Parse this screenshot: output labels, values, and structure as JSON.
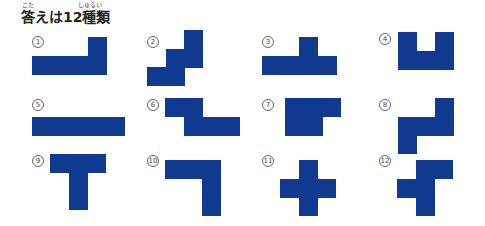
{
  "title": {
    "text": "答えは12種類",
    "ruby_kota": "こた",
    "ruby_shurui": "しゅるい"
  },
  "colors": {
    "piece": "#0f3a8f",
    "background": "#ffffff"
  },
  "cell_size": 18.5,
  "pieces": [
    {
      "label": "1",
      "label_pos": [
        32,
        36
      ],
      "origin": [
        32,
        37
      ],
      "cells": [
        [
          3,
          0
        ],
        [
          0,
          1
        ],
        [
          1,
          1
        ],
        [
          2,
          1
        ],
        [
          3,
          1
        ]
      ]
    },
    {
      "label": "2",
      "label_pos": [
        147,
        36
      ],
      "origin": [
        147,
        30
      ],
      "cells": [
        [
          2,
          0
        ],
        [
          1,
          1
        ],
        [
          2,
          1
        ],
        [
          0,
          2
        ],
        [
          1,
          2
        ]
      ]
    },
    {
      "label": "3",
      "label_pos": [
        262,
        36
      ],
      "origin": [
        262,
        37
      ],
      "cells": [
        [
          2,
          0
        ],
        [
          0,
          1
        ],
        [
          1,
          1
        ],
        [
          2,
          1
        ],
        [
          3,
          1
        ]
      ]
    },
    {
      "label": "4",
      "label_pos": [
        379,
        33
      ],
      "origin": [
        398,
        32
      ],
      "cells": [
        [
          0,
          0
        ],
        [
          2,
          0
        ],
        [
          0,
          1
        ],
        [
          1,
          1
        ],
        [
          2,
          1
        ]
      ]
    },
    {
      "label": "5",
      "label_pos": [
        32,
        99
      ],
      "origin": [
        32,
        117
      ],
      "cells": [
        [
          0,
          0
        ],
        [
          1,
          0
        ],
        [
          2,
          0
        ],
        [
          3,
          0
        ],
        [
          4,
          0
        ]
      ]
    },
    {
      "label": "6",
      "label_pos": [
        147,
        99
      ],
      "origin": [
        165,
        98
      ],
      "cells": [
        [
          0,
          0
        ],
        [
          1,
          0
        ],
        [
          1,
          1
        ],
        [
          2,
          1
        ],
        [
          3,
          1
        ]
      ]
    },
    {
      "label": "7",
      "label_pos": [
        262,
        99
      ],
      "origin": [
        285,
        98
      ],
      "cells": [
        [
          0,
          0
        ],
        [
          1,
          0
        ],
        [
          2,
          0
        ],
        [
          0,
          1
        ],
        [
          1,
          1
        ]
      ]
    },
    {
      "label": "8",
      "label_pos": [
        379,
        99
      ],
      "origin": [
        398,
        98
      ],
      "cells": [
        [
          2,
          0
        ],
        [
          0,
          1
        ],
        [
          1,
          1
        ],
        [
          2,
          1
        ],
        [
          0,
          2
        ]
      ]
    },
    {
      "label": "9",
      "label_pos": [
        32,
        155
      ],
      "origin": [
        50,
        154
      ],
      "cells": [
        [
          0,
          0
        ],
        [
          1,
          0
        ],
        [
          2,
          0
        ],
        [
          1,
          1
        ],
        [
          1,
          2
        ]
      ]
    },
    {
      "label": "10",
      "label_pos": [
        147,
        155
      ],
      "origin": [
        165,
        160
      ],
      "cells": [
        [
          0,
          0
        ],
        [
          1,
          0
        ],
        [
          2,
          0
        ],
        [
          2,
          1
        ],
        [
          2,
          2
        ]
      ]
    },
    {
      "label": "11",
      "label_pos": [
        262,
        155
      ],
      "origin": [
        280,
        160
      ],
      "cells": [
        [
          1,
          0
        ],
        [
          0,
          1
        ],
        [
          1,
          1
        ],
        [
          2,
          1
        ],
        [
          1,
          2
        ]
      ]
    },
    {
      "label": "12",
      "label_pos": [
        379,
        155
      ],
      "origin": [
        397,
        160
      ],
      "cells": [
        [
          1,
          0
        ],
        [
          2,
          0
        ],
        [
          0,
          1
        ],
        [
          1,
          1
        ],
        [
          1,
          2
        ]
      ]
    }
  ]
}
